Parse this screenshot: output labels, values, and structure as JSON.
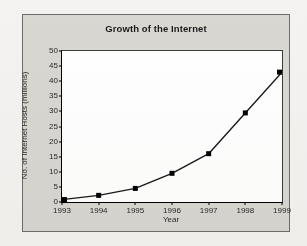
{
  "chart_data": {
    "type": "line",
    "title": "Growth of the Internet",
    "xlabel": "Year",
    "ylabel": "No. of Internet Hosts (millions)",
    "categories": [
      "1993",
      "1994",
      "1995",
      "1996",
      "1997",
      "1998",
      "1999"
    ],
    "values": [
      0.8,
      2.2,
      4.5,
      9.5,
      16.0,
      29.5,
      43.0
    ],
    "series": [
      {
        "name": "No. of Internet Hosts (millions)",
        "values": [
          0.8,
          2.2,
          4.5,
          9.5,
          16.0,
          29.5,
          43.0
        ]
      }
    ],
    "x": [
      1993,
      1994,
      1995,
      1996,
      1997,
      1998,
      1999
    ],
    "ylim": [
      0,
      50
    ],
    "xlim": [
      1993,
      1999
    ],
    "y_ticks": [
      0,
      5,
      10,
      15,
      20,
      25,
      30,
      35,
      40,
      45,
      50
    ],
    "y_tick_labels": [
      "0",
      "5",
      "10",
      "15",
      "20",
      "25",
      "30",
      "35",
      "40",
      "45",
      "50"
    ],
    "x_ticks": [
      1993,
      1994,
      1995,
      1996,
      1997,
      1998,
      1999
    ],
    "x_tick_labels": [
      "1993",
      "1994",
      "1995",
      "1996",
      "1997",
      "1998",
      "1999"
    ],
    "grid": false,
    "legend": false,
    "legend_position": "none",
    "marker": "square",
    "line_color": "#1a1a1a",
    "marker_color": "#000000",
    "plot_background": "#ffffff",
    "panel_background": "#d9d7d2",
    "panel_border_color": "#6f6d6a",
    "page_background": "#f4f3f1",
    "title_color": "#1b1b1b",
    "tick_label_color": "#2a2a2a"
  }
}
